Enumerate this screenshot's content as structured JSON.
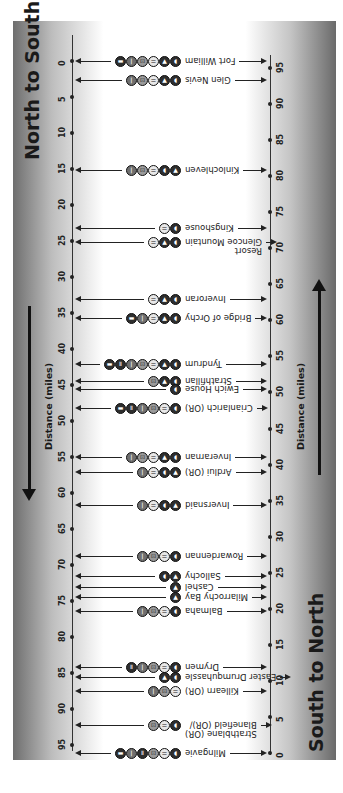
{
  "titles": {
    "north_to_south": "North to South",
    "south_to_north": "South to North"
  },
  "axis_labels": {
    "left": "Distance (miles)",
    "right": "Distance (miles)"
  },
  "left_axis_ticks": [
    "0",
    "5",
    "10",
    "15",
    "20",
    "25",
    "30",
    "35",
    "40",
    "45",
    "50",
    "55",
    "60",
    "65",
    "70",
    "75",
    "80",
    "85",
    "90",
    "95"
  ],
  "right_axis_ticks": [
    "95",
    "90",
    "85",
    "80",
    "75",
    "70",
    "65",
    "60",
    "55",
    "50",
    "45",
    "40",
    "35",
    "30",
    "25",
    "20",
    "15",
    "10",
    "5",
    "0"
  ],
  "legend_icons": {
    "campsite": "tent-icon",
    "hostel": "bed-icon",
    "food": "cutlery-icon",
    "shop": "shop-icon",
    "pub": "pint-icon",
    "transport": "train-icon"
  },
  "places": [
    {
      "name": "Fort William",
      "y": 61,
      "icons": [
        "c",
        "a",
        "fd",
        "sh",
        "in",
        "tr"
      ]
    },
    {
      "name": "Glen Nevis",
      "y": 80,
      "icons": [
        "c",
        "a",
        "fd",
        "sh",
        "in"
      ]
    },
    {
      "name": "Kinlochleven",
      "y": 170,
      "icons": [
        "a",
        "c",
        "fd",
        "sh",
        "in"
      ]
    },
    {
      "name": "Kingshouse",
      "y": 228,
      "icons": [
        "c",
        "fd"
      ]
    },
    {
      "name": "Glencoe Mountain Resort",
      "y": 242,
      "line1": "Resort",
      "line2": "Glencoe Mountain",
      "icons": [
        "c",
        "a",
        "fd"
      ]
    },
    {
      "name": "Inveroran",
      "y": 299,
      "icons": [
        "c",
        "a",
        "fd"
      ]
    },
    {
      "name": "Bridge of Orchy",
      "y": 318,
      "icons": [
        "c",
        "a",
        "fd",
        "in",
        "tr"
      ]
    },
    {
      "name": "Tyndrum",
      "y": 364,
      "icons": [
        "c",
        "a",
        "fd",
        "sh",
        "in",
        "pb",
        "tr"
      ]
    },
    {
      "name": "Strathfillan",
      "y": 381,
      "icons": [
        "c",
        "a",
        "sh"
      ]
    },
    {
      "name": "Ewich House",
      "y": 389,
      "icons": [
        "c"
      ]
    },
    {
      "name": "Crianlarich (OR)",
      "y": 408,
      "icons": [
        "c",
        "fd",
        "sh",
        "in",
        "pb",
        "tr"
      ]
    },
    {
      "name": "Inverarnan",
      "y": 457,
      "icons": [
        "c",
        "a",
        "fd",
        "sh",
        "in"
      ]
    },
    {
      "name": "Ardlui (OR)",
      "y": 472,
      "icons": [
        "a",
        "c",
        "fd",
        "in"
      ]
    },
    {
      "name": "Inversnaid",
      "y": 505,
      "icons": [
        "a",
        "c",
        "fd",
        "in"
      ]
    },
    {
      "name": "Rowardennan",
      "y": 556,
      "icons": [
        "c",
        "fd",
        "sh",
        "in"
      ]
    },
    {
      "name": "Sallochy",
      "y": 576,
      "icons": [
        "a",
        "c"
      ]
    },
    {
      "name": "Cashel",
      "y": 587,
      "icons": [
        "a"
      ]
    },
    {
      "name": "Milarrochy Bay",
      "y": 597,
      "icons": [
        "a"
      ]
    },
    {
      "name": "Balmaha",
      "y": 611,
      "icons": [
        "c",
        "fd",
        "sh",
        "in"
      ]
    },
    {
      "name": "Drymen",
      "y": 667,
      "icons": [
        "c",
        "fd",
        "sh",
        "in",
        "pb"
      ]
    },
    {
      "name": "Easter Drumquhassle",
      "y": 677,
      "icons": [
        "c",
        "a"
      ]
    },
    {
      "name": "Killearn (OR)",
      "y": 691,
      "icons": [
        "fd",
        "sh",
        "in"
      ]
    },
    {
      "name": "Blanefield (OR)/ Strathblane (OR)",
      "y": 725,
      "line1": "Strathblane (OR)",
      "line2": "Blanefield (OR)/",
      "icons": [
        "c",
        "fd",
        "sh"
      ]
    },
    {
      "name": "Milngavie",
      "y": 753,
      "icons": [
        "c",
        "fd",
        "sh",
        "pb",
        "in",
        "tr"
      ]
    }
  ],
  "icon_glyphs": {
    "c": {
      "name": "train-icon",
      "glyph": "◖",
      "shade": "dark"
    },
    "a": {
      "name": "tent-icon",
      "glyph": "▲",
      "shade": "dark"
    },
    "fd": {
      "name": "cutlery-icon",
      "glyph": "⚌",
      "shade": "light"
    },
    "sh": {
      "name": "shop-icon",
      "glyph": "⊡",
      "shade": "midlight"
    },
    "in": {
      "name": "pint-icon",
      "glyph": "ǀ",
      "shade": "mid"
    },
    "pb": {
      "name": "bed-icon",
      "glyph": "Ⅱ",
      "shade": "dark"
    },
    "tr": {
      "name": "bus-icon",
      "glyph": "▬",
      "shade": "dark"
    }
  }
}
